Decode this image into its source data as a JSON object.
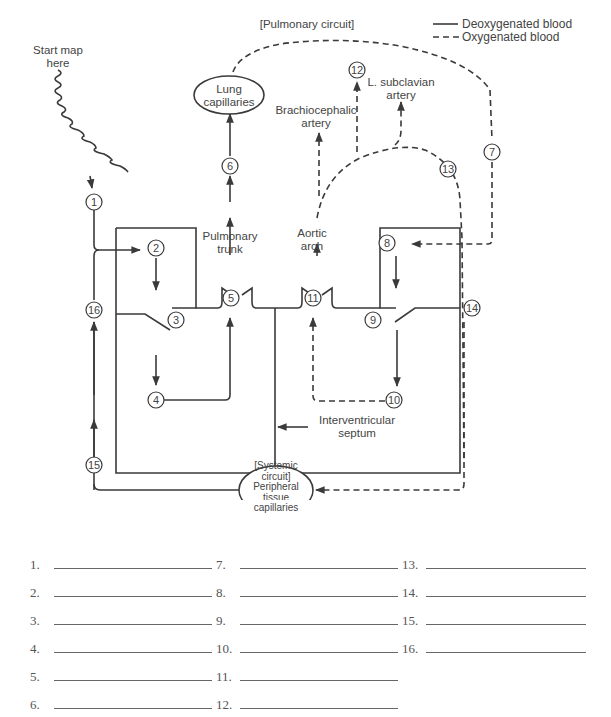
{
  "legend": {
    "deoxygenated": "Deoxygenated blood",
    "oxygenated": "Oxygenated blood"
  },
  "labels": {
    "pulmonary_circuit": "[Pulmonary circuit]",
    "start_map": [
      "Start map",
      "here"
    ],
    "lung_capillaries": [
      "Lung",
      "capillaries"
    ],
    "brachiocephalic": [
      "Brachiocephalic",
      "artery"
    ],
    "subclavian": [
      "L. subclavian",
      "artery"
    ],
    "pulmonary_trunk": [
      "Pulmonary",
      "trunk"
    ],
    "aortic_arch": [
      "Aortic",
      "arch"
    ],
    "interventricular": [
      "Interventricular",
      "septum"
    ],
    "systemic_circuit": [
      "[Systemic",
      "circuit]"
    ],
    "peripheral": [
      "Peripheral",
      "tissue",
      "capillaries"
    ]
  },
  "markers": [
    "1",
    "2",
    "3",
    "4",
    "5",
    "6",
    "7",
    "8",
    "9",
    "10",
    "11",
    "12",
    "13",
    "14",
    "15",
    "16"
  ],
  "answers": {
    "col1": [
      "1.",
      "2.",
      "3.",
      "4.",
      "5.",
      "6."
    ],
    "col2": [
      "7.",
      "8.",
      "9.",
      "10.",
      "11.",
      "12."
    ],
    "col3": [
      "13.",
      "14.",
      "15.",
      "16."
    ]
  },
  "colors": {
    "line": "#3a3a3a",
    "text": "#444444"
  }
}
